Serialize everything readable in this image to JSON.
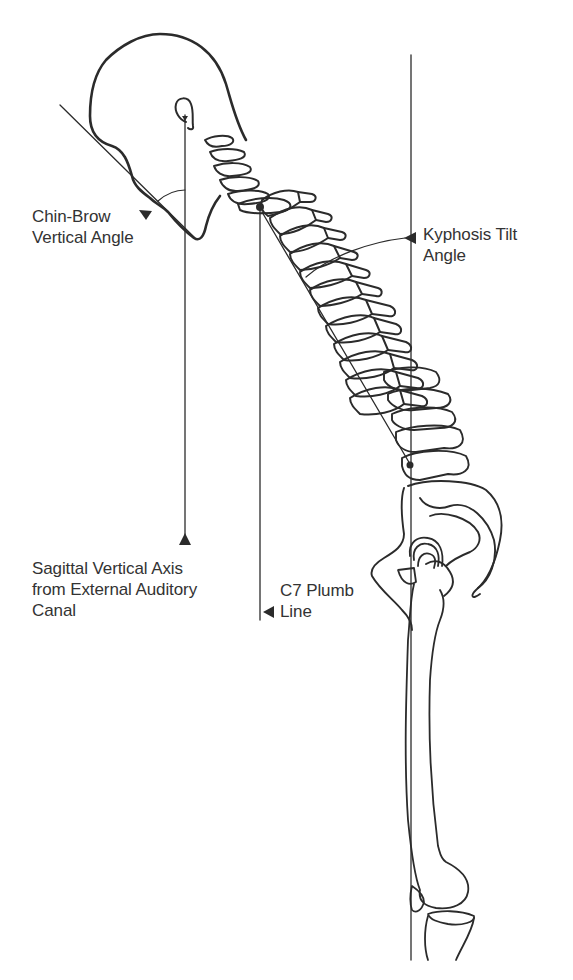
{
  "figure": {
    "type": "spinal sagittal alignment diagram",
    "colors": {
      "line": "#2b2b2b",
      "background": "#ffffff",
      "text": "#333333"
    },
    "annotations": [
      {
        "id": "chin-brow",
        "lines": [
          "Chin-Brow",
          "Vertical Angle"
        ],
        "pointer": "arrowhead pointing to chin-brow angle arc"
      },
      {
        "id": "kyphosis-tilt",
        "lines": [
          "Kyphosis Tilt",
          "Angle"
        ],
        "pointer": "arrowhead pointing to kyphosis tilt angle arc"
      },
      {
        "id": "sva",
        "lines": [
          "Sagittal Vertical Axis",
          "from External Auditory",
          "Canal"
        ],
        "pointer": "upward arrowhead at bottom of vertical line from ear"
      },
      {
        "id": "c7-plumb",
        "lines": [
          "C7 Plumb",
          "Line"
        ],
        "pointer": "leftward arrowhead at bottom of C7 plumb line"
      }
    ],
    "anatomy": [
      "skull",
      "cervical spine",
      "thoracic spine",
      "lumbar spine",
      "pelvis",
      "femur",
      "patella",
      "tibia"
    ]
  }
}
